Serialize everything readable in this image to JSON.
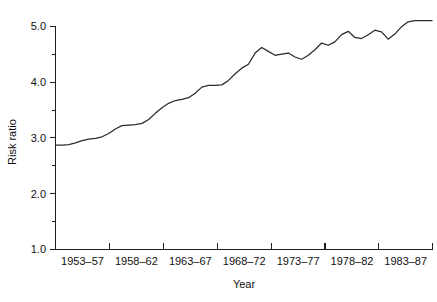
{
  "chart_data": {
    "type": "line",
    "title": "",
    "xlabel": "Year",
    "ylabel": "Risk ratio",
    "ylim": [
      1.0,
      5.2
    ],
    "grid": false,
    "legend": null,
    "y_ticks": [
      "1.0",
      "2.0",
      "3.0",
      "4.0",
      "5.0"
    ],
    "y_tick_values": [
      1.0,
      2.0,
      3.0,
      4.0,
      5.0
    ],
    "y_minor_tick_values": [
      1.5,
      2.5,
      3.5,
      4.5
    ],
    "categories": [
      "1953–57",
      "1958–62",
      "1963–67",
      "1968–72",
      "1973–77",
      "1978–82",
      "1983–87"
    ],
    "x_axis_note": "five-year moving period labels centred between axis ticks",
    "series": [
      {
        "name": "Risk ratio",
        "color": "#2b2b2b",
        "x": [
          1953.0,
          1953.6,
          1954.2,
          1954.8,
          1955.4,
          1956.0,
          1956.6,
          1957.2,
          1957.8,
          1958.4,
          1959.0,
          1959.6,
          1960.2,
          1960.8,
          1961.4,
          1962.0,
          1962.6,
          1963.2,
          1963.8,
          1964.4,
          1965.0,
          1965.6,
          1966.2,
          1966.8,
          1967.4,
          1968.0,
          1968.6,
          1969.2,
          1969.8,
          1970.4,
          1971.0,
          1971.6,
          1972.2,
          1972.8,
          1973.4,
          1974.0,
          1974.6,
          1975.2,
          1975.8,
          1976.4,
          1977.0,
          1977.6,
          1978.2,
          1978.8,
          1979.4,
          1980.0,
          1980.6,
          1981.2,
          1981.8,
          1982.4,
          1983.0,
          1983.6,
          1984.2,
          1984.8,
          1985.4,
          1986.0,
          1986.6,
          1987.0
        ],
        "values": [
          2.87,
          2.87,
          2.88,
          2.91,
          2.95,
          2.98,
          2.99,
          3.02,
          3.08,
          3.16,
          3.22,
          3.23,
          3.24,
          3.26,
          3.33,
          3.44,
          3.54,
          3.62,
          3.67,
          3.69,
          3.72,
          3.8,
          3.91,
          3.94,
          3.94,
          3.95,
          4.03,
          4.15,
          4.25,
          4.32,
          4.52,
          4.62,
          4.55,
          4.48,
          4.5,
          4.52,
          4.45,
          4.41,
          4.48,
          4.58,
          4.7,
          4.66,
          4.72,
          4.85,
          4.91,
          4.8,
          4.78,
          4.85,
          4.93,
          4.9,
          4.77,
          4.86,
          4.99,
          5.08,
          5.1,
          5.1,
          5.1,
          5.1
        ]
      }
    ]
  },
  "axes": {
    "y_title": "Risk ratio",
    "x_title": "Year"
  }
}
